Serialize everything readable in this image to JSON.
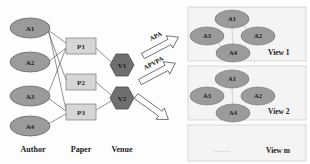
{
  "figure": {
    "background": "#fdfdfd",
    "colors": {
      "author_node_fill": "#9b9b9b",
      "author_node_stroke": "#5a5a5a",
      "paper_node_fill": "#d6d6d6",
      "paper_node_stroke": "#7a7a7a",
      "venue_node_fill": "#6f6f6f",
      "venue_node_stroke": "#3c3c3c",
      "edge_stroke": "#4a4a4a",
      "view_box_fill": "#f4f4f4",
      "view_box_stroke": "#cfcfcf",
      "view_edge_stroke": "#c9c9c9",
      "arrow_fill": "#ffffff",
      "arrow_stroke": "#4a4a4a",
      "text": "#1a1a1a"
    }
  },
  "left_panel": {
    "column_labels": [
      {
        "id": "author",
        "text": "Author",
        "x": 33,
        "y": 150
      },
      {
        "id": "paper",
        "text": "Paper",
        "x": 81,
        "y": 150
      },
      {
        "id": "venue",
        "text": "Venue",
        "x": 122,
        "y": 150
      }
    ],
    "author_nodes": [
      {
        "id": "A1",
        "label": "A1",
        "cx": 30,
        "cy": 28,
        "rx": 20,
        "ry": 10
      },
      {
        "id": "A2",
        "label": "A2",
        "cx": 30,
        "cy": 62,
        "rx": 20,
        "ry": 10
      },
      {
        "id": "A3",
        "label": "A3",
        "cx": 30,
        "cy": 96,
        "rx": 20,
        "ry": 10
      },
      {
        "id": "A4",
        "label": "A4",
        "cx": 30,
        "cy": 126,
        "rx": 20,
        "ry": 10
      }
    ],
    "paper_nodes": [
      {
        "id": "P1",
        "label": "P1",
        "x": 66,
        "y": 38,
        "w": 30,
        "h": 16
      },
      {
        "id": "P2",
        "label": "P2",
        "x": 66,
        "y": 74,
        "w": 30,
        "h": 16
      },
      {
        "id": "P3",
        "label": "P3",
        "x": 66,
        "y": 104,
        "w": 30,
        "h": 16
      }
    ],
    "venue_nodes": [
      {
        "id": "V1",
        "label": "V1",
        "cx": 122,
        "cy": 65,
        "r": 12
      },
      {
        "id": "V2",
        "label": "V2",
        "cx": 122,
        "cy": 98,
        "r": 12
      }
    ],
    "author_paper_edges": [
      {
        "from": "A1",
        "to": "P1"
      },
      {
        "from": "A1",
        "to": "P2"
      },
      {
        "from": "A1",
        "to": "P3"
      },
      {
        "from": "A2",
        "to": "P1"
      },
      {
        "from": "A3",
        "to": "P1"
      },
      {
        "from": "A3",
        "to": "P3"
      },
      {
        "from": "A4",
        "to": "P3"
      }
    ],
    "paper_venue_edges": [
      {
        "from": "P1",
        "to": "V1"
      },
      {
        "from": "P2",
        "to": "V2"
      },
      {
        "from": "P3",
        "to": "V2"
      }
    ]
  },
  "arrows": [
    {
      "id": "apa",
      "label": "APA",
      "label_x": 151,
      "label_y": 41,
      "rotation": -28
    },
    {
      "id": "apvpa",
      "label": "APVPA",
      "label_x": 147,
      "label_y": 72,
      "rotation": -28
    },
    {
      "id": "unlabeled",
      "label": "",
      "label_x": 0,
      "label_y": 0,
      "rotation": 35
    }
  ],
  "right_panel": {
    "views": [
      {
        "id": "view-1",
        "label": "View 1",
        "box": {
          "x": 188,
          "y": 7,
          "w": 118,
          "h": 54
        },
        "label_pos": {
          "x": 268,
          "y": 52
        },
        "nodes": [
          {
            "id": "A1",
            "label": "A1",
            "cx": 232,
            "cy": 19,
            "rx": 17,
            "ry": 9
          },
          {
            "id": "A3",
            "label": "A3",
            "cx": 207,
            "cy": 36,
            "rx": 17,
            "ry": 9
          },
          {
            "id": "A2",
            "label": "A2",
            "cx": 258,
            "cy": 36,
            "rx": 17,
            "ry": 9
          },
          {
            "id": "A4",
            "label": "A4",
            "cx": 233,
            "cy": 53,
            "rx": 17,
            "ry": 9
          }
        ],
        "edges": [
          {
            "from": "A1",
            "to": "A2"
          },
          {
            "from": "A1",
            "to": "A4"
          },
          {
            "from": "A3",
            "to": "A4"
          }
        ]
      },
      {
        "id": "view-2",
        "label": "View 2",
        "box": {
          "x": 188,
          "y": 66,
          "w": 118,
          "h": 54
        },
        "label_pos": {
          "x": 268,
          "y": 111
        },
        "nodes": [
          {
            "id": "A1",
            "label": "A1",
            "cx": 232,
            "cy": 79,
            "rx": 17,
            "ry": 9
          },
          {
            "id": "A3",
            "label": "A3",
            "cx": 207,
            "cy": 96,
            "rx": 17,
            "ry": 9
          },
          {
            "id": "A2",
            "label": "A2",
            "cx": 258,
            "cy": 96,
            "rx": 17,
            "ry": 9
          },
          {
            "id": "A4",
            "label": "A4",
            "cx": 233,
            "cy": 113,
            "rx": 17,
            "ry": 9
          }
        ],
        "edges": [
          {
            "from": "A1",
            "to": "A4"
          }
        ]
      },
      {
        "id": "view-m",
        "label": "View m",
        "box": {
          "x": 188,
          "y": 125,
          "w": 118,
          "h": 36
        },
        "label_pos": {
          "x": 266,
          "y": 150
        },
        "nodes": [],
        "edges": [],
        "ellipsis": "......",
        "ellipsis_pos": {
          "x": 222,
          "y": 150
        }
      }
    ]
  }
}
